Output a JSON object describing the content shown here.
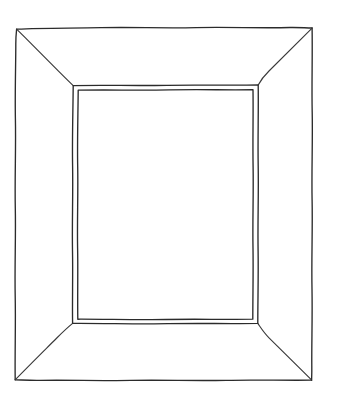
{
  "image": {
    "kind": "line-drawing",
    "subject": "picture-frame",
    "description": "Hand-drawn black-ink outline sketch of an empty rectangular picture frame shown face-on, with mitred corner diagonals and a double-line inner bevel edge around a blank aperture.",
    "width": 337,
    "height": 404,
    "background_color": "#ffffff",
    "ink_color": "#2b2b2b",
    "ink_color_secondary": "#3a3a3a",
    "stroke_style": "wavy hand-drawn single-weight pen line",
    "fill": "none (blank white interior)",
    "text_content": "none"
  },
  "geometry": {
    "outer_rect": {
      "label": "outer frame edge",
      "left": 16,
      "top": 28,
      "right": 312,
      "bottom": 380,
      "width": 296,
      "height": 352
    },
    "bevel_outer_rect": {
      "label": "inner frame lip (outer line of double bevel)",
      "left": 73,
      "top": 85,
      "right": 258,
      "bottom": 323,
      "width": 185,
      "height": 238
    },
    "aperture_rect": {
      "label": "picture aperture (inner line of double bevel)",
      "left": 78,
      "top": 90,
      "right": 253,
      "bottom": 319,
      "width": 175,
      "height": 229
    },
    "bevel_gap_px": 4,
    "miter_diagonals": [
      {
        "name": "top-left-miter",
        "from": [
          16,
          28
        ],
        "to": [
          73,
          85
        ]
      },
      {
        "name": "top-right-miter",
        "from": [
          312,
          28
        ],
        "to": [
          258,
          85
        ]
      },
      {
        "name": "bottom-left-miter",
        "from": [
          16,
          380
        ],
        "to": [
          73,
          323
        ]
      },
      {
        "name": "bottom-right-miter",
        "from": [
          312,
          380
        ],
        "to": [
          258,
          323
        ]
      }
    ],
    "frame_face_widths": {
      "left": 57,
      "right": 54,
      "top": 57,
      "bottom": 57
    }
  },
  "parts": [
    {
      "name": "outer-edge",
      "label": "Outer frame edge"
    },
    {
      "name": "frame-face",
      "label": "Bevelled frame face"
    },
    {
      "name": "miter-diagonals",
      "label": "Corner mitre lines"
    },
    {
      "name": "inner-bevel",
      "label": "Inner bevel double line"
    },
    {
      "name": "aperture",
      "label": "Empty picture aperture"
    }
  ]
}
